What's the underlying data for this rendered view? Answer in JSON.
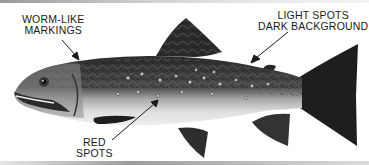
{
  "diagram": {
    "labels": [
      {
        "id": "worm-like-markings",
        "lines": [
          "WORM-LIKE",
          "MARKINGS"
        ]
      },
      {
        "id": "light-spots",
        "lines": [
          "LIGHT SPOTS",
          "DARK BACKGROUND"
        ]
      },
      {
        "id": "red-spots",
        "lines": [
          "RED",
          "SPOTS"
        ]
      }
    ],
    "colors": {
      "background": "#ffffff",
      "ink": "#1a1a1a",
      "dark_body": "#2a2a2a",
      "belly": "#e4e4e4",
      "tail": "#1e1e1e"
    }
  }
}
